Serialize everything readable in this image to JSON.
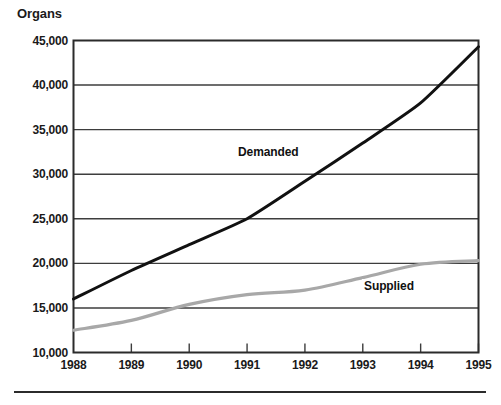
{
  "chart_data": {
    "type": "line",
    "title": "",
    "ylabel": "Organs",
    "xlabel": "",
    "ylim": [
      10000,
      45000
    ],
    "xlim": [
      1988,
      1995
    ],
    "grid": true,
    "legend_position": "inline",
    "x": [
      1988,
      1989,
      1990,
      1991,
      1992,
      1993,
      1994,
      1995
    ],
    "ytick_labels": [
      "45,000",
      "40,000",
      "35,000",
      "30,000",
      "25,000",
      "20,000",
      "15,000",
      "10,000"
    ],
    "ytick_values": [
      45000,
      40000,
      35000,
      30000,
      25000,
      20000,
      15000,
      10000
    ],
    "xtick_labels": [
      "1988",
      "1989",
      "1990",
      "1991",
      "1992",
      "1993",
      "1994",
      "1995"
    ],
    "series": [
      {
        "name": "Demanded",
        "color": "#111111",
        "values": [
          16000,
          19200,
          22100,
          25000,
          29200,
          33500,
          38000,
          44300
        ]
      },
      {
        "name": "Supplied",
        "color": "#a8a8a8",
        "values": [
          12500,
          13600,
          15400,
          16500,
          17000,
          18400,
          19900,
          20300
        ]
      }
    ]
  },
  "labels": {
    "organs": "Organs",
    "demanded": "Demanded",
    "supplied": "Supplied"
  },
  "colors": {
    "axis": "#2b2b2b",
    "grid": "#3d3d3d",
    "demanded": "#111111",
    "supplied": "#a8a8a8",
    "background": "#ffffff"
  }
}
